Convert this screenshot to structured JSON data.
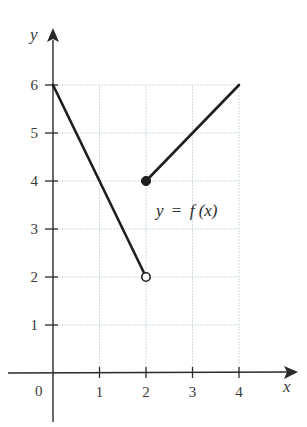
{
  "chart_data": {
    "type": "line",
    "title": "",
    "xlabel": "x",
    "ylabel": "y",
    "xlim": [
      0,
      4
    ],
    "ylim": [
      0,
      6
    ],
    "x_ticks": [
      "0",
      "1",
      "2",
      "3",
      "4"
    ],
    "y_ticks": [
      "1",
      "2",
      "3",
      "4",
      "5",
      "6"
    ],
    "grid": true,
    "annotation": "y = f(x)",
    "series": [
      {
        "name": "f(x) segment 1",
        "x": [
          0,
          2
        ],
        "y": [
          6,
          2
        ],
        "start_point": "closed-implicit",
        "end_point": "open"
      },
      {
        "name": "f(x) segment 2",
        "x": [
          2,
          4
        ],
        "y": [
          4,
          6
        ],
        "start_point": "closed",
        "end_point": "none"
      }
    ],
    "points": [
      {
        "x": 2,
        "y": 2,
        "style": "open-circle"
      },
      {
        "x": 2,
        "y": 4,
        "style": "filled-circle"
      }
    ],
    "colors": {
      "line": "#1e1e1e",
      "grid": "#cfdde3",
      "axis": "#2a2a2a",
      "text": "#3a3a3a"
    }
  },
  "labels": {
    "x_axis": "x",
    "y_axis": "y",
    "origin": "0",
    "annotation_y": "y",
    "annotation_eq": "=",
    "annotation_f": "f",
    "annotation_paren": "(x)"
  }
}
